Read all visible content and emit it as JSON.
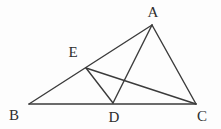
{
  "figure": {
    "background_color": "#fdfdfd",
    "stroke_color": "#3b3b3b",
    "label_color": "#2e2e2e",
    "stroke_width": 1.4,
    "width": 221,
    "height": 129
  },
  "points": {
    "A": {
      "label": "A",
      "x": 152,
      "y": 25,
      "label_x": 153,
      "label_y": 12
    },
    "B": {
      "label": "B",
      "x": 29,
      "y": 104,
      "label_x": 14,
      "label_y": 115
    },
    "C": {
      "label": "C",
      "x": 196,
      "y": 104,
      "label_x": 202,
      "label_y": 116
    },
    "D": {
      "label": "D",
      "x": 113,
      "y": 103,
      "label_x": 114,
      "label_y": 117
    },
    "E": {
      "label": "E",
      "x": 86,
      "y": 68,
      "label_x": 73,
      "label_y": 52
    }
  },
  "segments": [
    {
      "name": "segment-AB",
      "from": "A",
      "to": "B",
      "path": "M 152 25 L 29 104"
    },
    {
      "name": "segment-BC",
      "from": "B",
      "to": "C",
      "path": "M 29 104 L 196 104"
    },
    {
      "name": "segment-CA",
      "from": "C",
      "to": "A",
      "path": "M 196 104 L 152 25"
    },
    {
      "name": "segment-AD",
      "from": "A",
      "to": "D",
      "path": "M 152 25 L 113 103"
    },
    {
      "name": "segment-ED",
      "from": "E",
      "to": "D",
      "path": "M 86 68 L 113 103"
    },
    {
      "name": "segment-EC",
      "from": "E",
      "to": "C",
      "path": "M 86 68 L 196 104"
    }
  ],
  "chart_data": {
    "type": "diagram",
    "vertices": [
      {
        "name": "A",
        "x": 152,
        "y": 25
      },
      {
        "name": "B",
        "x": 29,
        "y": 104
      },
      {
        "name": "C",
        "x": 196,
        "y": 104
      },
      {
        "name": "D",
        "x": 113,
        "y": 103
      },
      {
        "name": "E",
        "x": 86,
        "y": 68
      }
    ],
    "edges": [
      [
        "A",
        "B"
      ],
      [
        "B",
        "C"
      ],
      [
        "C",
        "A"
      ],
      [
        "A",
        "D"
      ],
      [
        "E",
        "D"
      ],
      [
        "E",
        "C"
      ]
    ]
  }
}
